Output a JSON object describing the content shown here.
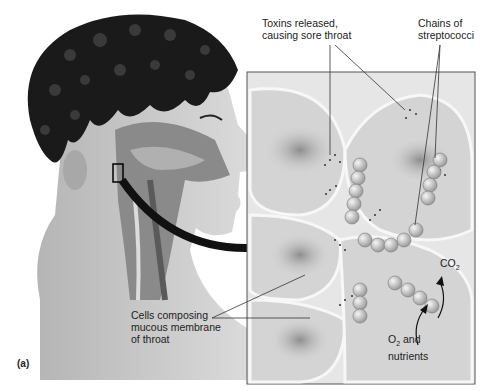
{
  "figure": {
    "panel_label": "(a)",
    "labels": {
      "toxins_line1": "Toxins released,",
      "toxins_line2": "causing sore throat",
      "chains_line1": "Chains of",
      "chains_line2": "streptococci",
      "cells_line1": "Cells composing",
      "cells_line2": "mucous membrane",
      "cells_line3": "of throat",
      "co2": "CO",
      "co2_sub": "2",
      "o2": "O",
      "o2_sub": "2",
      "o2_rest": " and",
      "nutrients": "nutrients"
    },
    "colors": {
      "hair": "#1a1a1a",
      "skin": "#cfcfcf",
      "throat_tissue": "#8a8a8a",
      "inset_bg": "#e8e8e8",
      "cell_nucleus": "#9a9a9a",
      "bacteria": "#d8d8d8",
      "arrow": "#111111"
    }
  }
}
